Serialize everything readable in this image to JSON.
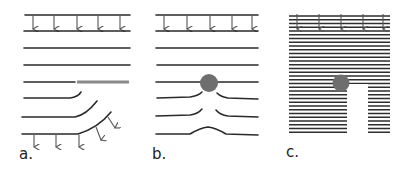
{
  "figure": {
    "background": "#ffffff",
    "line_color": "#2a2a2a",
    "obstacle_color": "#6e6e6e",
    "panels": [
      {
        "id": "a",
        "label": "a.",
        "description": "Planar layers with a straight bar inserted; layers below bend downward, arrows show motion"
      },
      {
        "id": "b",
        "label": "b.",
        "description": "Planar layers with a circular obstacle; layers bend around it leaving a bump"
      },
      {
        "id": "c",
        "label": "c.",
        "description": "Densely packed layers with a circular obstacle leaving a vertical gap below"
      }
    ]
  }
}
